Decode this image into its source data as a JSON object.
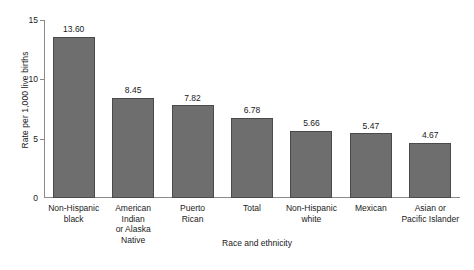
{
  "chart_data": {
    "type": "bar",
    "title": "",
    "xlabel": "Race and ethnicity",
    "ylabel": "Rate per 1,000 live births",
    "categories": [
      "Non-Hispanic black",
      "American Indian or Alaska Native",
      "Puerto Rican",
      "Total",
      "Non-Hispanic white",
      "Mexican",
      "Asian or Pacific Islander"
    ],
    "category_lines": [
      [
        "Non-Hispanic",
        "black"
      ],
      [
        "American Indian",
        "or Alaska Native"
      ],
      [
        "Puerto",
        "Rican"
      ],
      [
        "Total"
      ],
      [
        "Non-Hispanic",
        "white"
      ],
      [
        "Mexican"
      ],
      [
        "Asian or",
        "Pacific Islander"
      ]
    ],
    "values": [
      13.6,
      8.45,
      7.82,
      6.78,
      5.66,
      5.47,
      4.67
    ],
    "value_labels": [
      "13.60",
      "8.45",
      "7.82",
      "6.78",
      "5.66",
      "5.47",
      "4.67"
    ],
    "ylim": [
      0,
      15
    ],
    "yticks": [
      0,
      5,
      10,
      15
    ],
    "ytick_labels": [
      "0",
      "5",
      "10",
      "15"
    ],
    "grid": false,
    "legend": false,
    "bar_color": "#6e6e6e",
    "bar_edge_color": "#4a4a4a",
    "axis_color": "#8a8a8a",
    "text_color": "#1a1a1a"
  }
}
